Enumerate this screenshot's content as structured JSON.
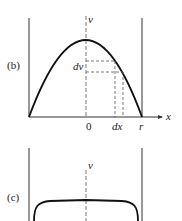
{
  "panel_b": {
    "label": "(b)",
    "axis_v": "v",
    "axis_x": "x",
    "tick_zero": "0",
    "tick_dx": "dx",
    "tick_r": "r",
    "label_dv": "dv",
    "curve": "parabola (laminar velocity profile)"
  },
  "panel_c": {
    "label": "(c)",
    "axis_v": "v",
    "curve": "flat plateau (turbulent velocity profile)"
  },
  "colors": {
    "ink": "#222222",
    "background": "#ffffff"
  }
}
